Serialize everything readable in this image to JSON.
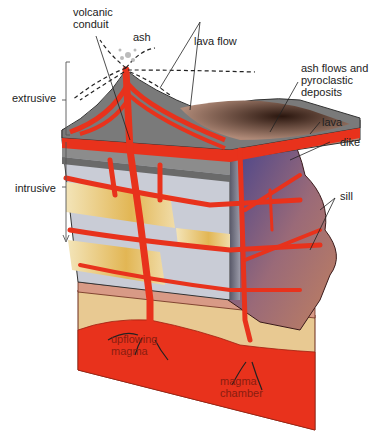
{
  "diagram": {
    "labels": {
      "volcanic_conduit": "volcanic\nconduit",
      "ash": "ash",
      "lava_flow": "lava flow",
      "ash_flows": "ash flows and\npyroclastic\ndeposits",
      "lava": "lava",
      "dike": "dike",
      "sill": "sill",
      "extrusive": "extrusive",
      "intrusive": "intrusive",
      "upflowing_magma": "upflowing\nmagma",
      "magma_chamber": "magma\nchamber"
    },
    "colors": {
      "magma": "#e8321c",
      "magma_dark": "#c42a18",
      "rock_gray": "#8c8c8c",
      "rock_light": "#c9ccd6",
      "sandstone": "#e6c06a",
      "tan": "#e8c992",
      "pluton_blue": "#3c3f8f",
      "pluton_brown": "#b77a5a",
      "ash_dark": "#3a2418",
      "ink": "#222222"
    }
  }
}
